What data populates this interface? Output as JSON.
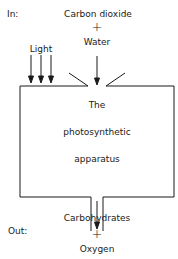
{
  "diagram": {
    "in_label": "In:",
    "out_label": "Out:",
    "inputs": {
      "carbon_dioxide": "Carbon dioxide",
      "plus": "+",
      "water": "Water",
      "light": "Light"
    },
    "box": {
      "line1": "The",
      "line2": "photosynthetic",
      "line3": "apparatus"
    },
    "outputs": {
      "carbohydrates": "Carbohydrates",
      "plus": "+",
      "oxygen": "Oxygen"
    },
    "colors": {
      "line": "#1a1a1a",
      "background": "#ffffff"
    }
  }
}
